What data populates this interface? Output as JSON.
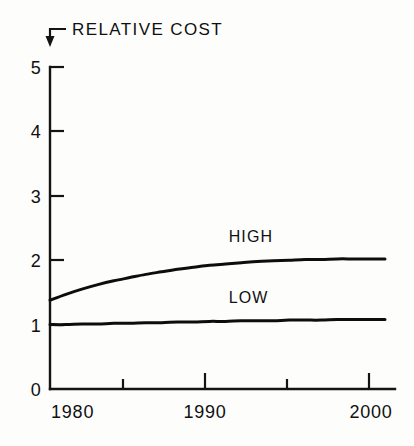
{
  "chart_data": {
    "type": "line",
    "title": "RELATIVE COST",
    "xlabel": "",
    "ylabel": "RELATIVE COST",
    "xlim": [
      1980,
      2001
    ],
    "ylim": [
      0,
      5
    ],
    "grid": false,
    "legend_position": "inline-labels",
    "x_tick_labels": [
      "1980",
      "1990",
      "2000"
    ],
    "x_tick_values": [
      1980,
      1990,
      2000
    ],
    "x_minor_tick_values": [
      1985,
      1990,
      1995,
      2000
    ],
    "y_tick_labels": [
      "0",
      "1",
      "2",
      "3",
      "4",
      "5"
    ],
    "y_tick_values": [
      0,
      1,
      2,
      3,
      4,
      5
    ],
    "x": [
      1980,
      1981,
      1982,
      1983,
      1984,
      1985,
      1986,
      1987,
      1988,
      1989,
      1990,
      1991,
      1992,
      1993,
      1994,
      1995,
      1996,
      1997,
      1998,
      1999,
      2000,
      2001
    ],
    "series": [
      {
        "name": "HIGH",
        "label": "HIGH",
        "values": [
          1.38,
          1.47,
          1.55,
          1.62,
          1.68,
          1.73,
          1.78,
          1.82,
          1.86,
          1.89,
          1.92,
          1.94,
          1.96,
          1.98,
          1.99,
          2.0,
          2.01,
          2.01,
          2.02,
          2.02,
          2.02,
          2.02
        ]
      },
      {
        "name": "LOW",
        "label": "LOW",
        "values": [
          1.0,
          1.0,
          1.01,
          1.01,
          1.02,
          1.02,
          1.03,
          1.03,
          1.04,
          1.04,
          1.05,
          1.05,
          1.06,
          1.06,
          1.06,
          1.07,
          1.07,
          1.07,
          1.08,
          1.08,
          1.08,
          1.08
        ]
      }
    ],
    "annotations": [
      {
        "text": "HIGH",
        "x": 1991.2,
        "y": 2.28
      },
      {
        "text": "LOW",
        "x": 1991.2,
        "y": 1.34
      }
    ]
  },
  "axis": {
    "y_labels": [
      {
        "label": "5"
      },
      {
        "label": "4"
      },
      {
        "label": "3"
      },
      {
        "label": "2"
      },
      {
        "label": "1"
      },
      {
        "label": "0"
      }
    ],
    "x_labels": [
      {
        "label": "1980"
      },
      {
        "label": "1990"
      },
      {
        "label": "2000"
      }
    ]
  },
  "colors": {
    "ink": "#111111",
    "background": "#fdfdfc",
    "series_high": "#0d0d0d",
    "series_low": "#0d0d0d"
  }
}
